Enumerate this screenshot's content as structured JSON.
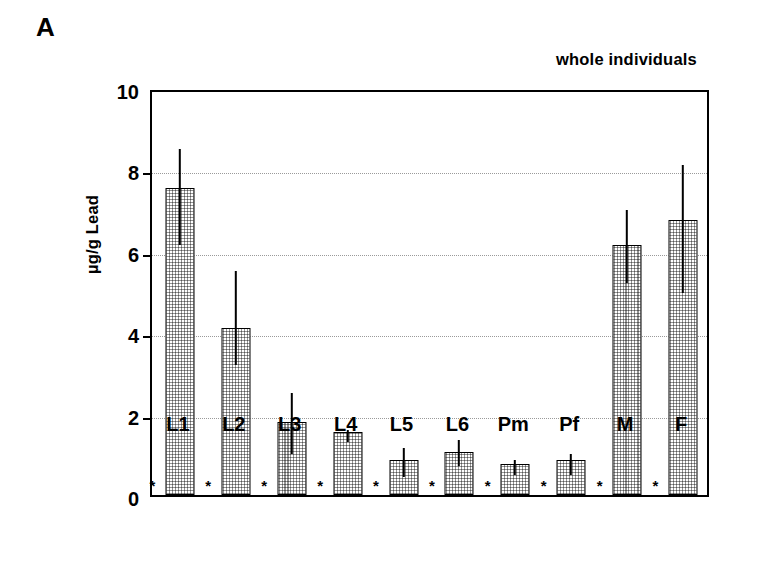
{
  "figure": {
    "panel_letter": "A"
  },
  "chart_data": {
    "type": "bar",
    "title": "whole individuals",
    "xlabel": "",
    "ylabel": "µg/g Lead",
    "ylim": [
      0,
      10
    ],
    "ytick_labels": [
      "0",
      "2",
      "4",
      "6",
      "8",
      "10"
    ],
    "ytick_values": [
      0,
      2,
      4,
      6,
      8,
      10
    ],
    "grid": true,
    "legend": "none",
    "categories": [
      "L1",
      "L2",
      "L3",
      "L4",
      "L5",
      "L6",
      "Pm",
      "Pf",
      "M",
      "F"
    ],
    "values": [
      7.55,
      4.1,
      1.8,
      1.55,
      0.85,
      1.05,
      0.75,
      0.85,
      6.15,
      6.75
    ],
    "error_low": [
      6.25,
      3.3,
      1.1,
      1.4,
      0.55,
      0.8,
      0.6,
      0.6,
      5.3,
      5.05
    ],
    "error_high": [
      8.6,
      5.6,
      2.6,
      1.7,
      1.25,
      1.45,
      0.95,
      1.1,
      7.1,
      8.2
    ],
    "annotations": [
      "*",
      "*",
      "*",
      "*",
      "*",
      "*",
      "*",
      "*",
      "*",
      "*"
    ],
    "annotation_note": "asterisk below each bar at the baseline"
  }
}
